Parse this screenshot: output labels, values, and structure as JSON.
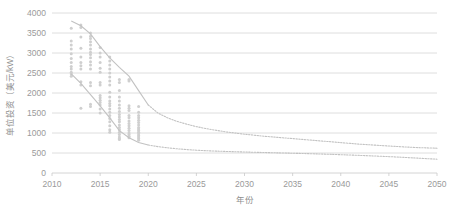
{
  "chart_data": {
    "type": "scatter",
    "title": "",
    "xlabel": "年份",
    "ylabel": "单位投资（美元/kW）",
    "xlim": [
      2010,
      2050
    ],
    "ylim": [
      0,
      4000
    ],
    "xticks": [
      2010,
      2015,
      2020,
      2025,
      2030,
      2035,
      2040,
      2045,
      2050
    ],
    "yticks": [
      0,
      500,
      1000,
      1500,
      2000,
      2500,
      3000,
      3500,
      4000
    ],
    "grid": true,
    "legend": "none",
    "series": [
      {
        "name": "项目散点",
        "type": "scatter",
        "marker": "circle",
        "color": "#cfcfcf",
        "points": [
          [
            2012,
            3620
          ],
          [
            2012,
            3300
          ],
          [
            2012,
            3200
          ],
          [
            2012,
            3100
          ],
          [
            2012,
            2980
          ],
          [
            2012,
            2860
          ],
          [
            2012,
            2760
          ],
          [
            2012,
            2660
          ],
          [
            2012,
            2600
          ],
          [
            2012,
            2520
          ],
          [
            2012,
            2480
          ],
          [
            2012,
            2420
          ],
          [
            2013,
            3700
          ],
          [
            2013,
            3640
          ],
          [
            2013,
            3400
          ],
          [
            2013,
            3120
          ],
          [
            2013,
            2900
          ],
          [
            2013,
            2760
          ],
          [
            2013,
            2680
          ],
          [
            2013,
            2600
          ],
          [
            2013,
            2280
          ],
          [
            2013,
            2200
          ],
          [
            2013,
            1620
          ],
          [
            2014,
            3500
          ],
          [
            2014,
            3420
          ],
          [
            2014,
            3360
          ],
          [
            2014,
            3280
          ],
          [
            2014,
            3200
          ],
          [
            2014,
            3100
          ],
          [
            2014,
            3020
          ],
          [
            2014,
            2960
          ],
          [
            2014,
            2880
          ],
          [
            2014,
            2780
          ],
          [
            2014,
            2700
          ],
          [
            2014,
            2600
          ],
          [
            2014,
            2260
          ],
          [
            2014,
            2180
          ],
          [
            2014,
            1720
          ],
          [
            2014,
            1660
          ],
          [
            2015,
            3140
          ],
          [
            2015,
            3000
          ],
          [
            2015,
            2900
          ],
          [
            2015,
            2760
          ],
          [
            2015,
            2620
          ],
          [
            2015,
            2520
          ],
          [
            2015,
            2260
          ],
          [
            2015,
            2200
          ],
          [
            2015,
            1940
          ],
          [
            2015,
            1880
          ],
          [
            2015,
            1820
          ],
          [
            2015,
            1760
          ],
          [
            2015,
            1700
          ],
          [
            2015,
            1600
          ],
          [
            2015,
            1500
          ],
          [
            2016,
            2900
          ],
          [
            2016,
            2800
          ],
          [
            2016,
            2700
          ],
          [
            2016,
            2600
          ],
          [
            2016,
            2500
          ],
          [
            2016,
            2400
          ],
          [
            2016,
            2300
          ],
          [
            2016,
            2200
          ],
          [
            2016,
            2020
          ],
          [
            2016,
            1900
          ],
          [
            2016,
            1800
          ],
          [
            2016,
            1740
          ],
          [
            2016,
            1680
          ],
          [
            2016,
            1600
          ],
          [
            2016,
            1520
          ],
          [
            2016,
            1440
          ],
          [
            2016,
            1360
          ],
          [
            2016,
            1280
          ],
          [
            2016,
            1180
          ],
          [
            2016,
            1080
          ],
          [
            2016,
            1020
          ],
          [
            2017,
            2340
          ],
          [
            2017,
            2260
          ],
          [
            2017,
            2060
          ],
          [
            2017,
            1900
          ],
          [
            2017,
            1800
          ],
          [
            2017,
            1700
          ],
          [
            2017,
            1620
          ],
          [
            2017,
            1540
          ],
          [
            2017,
            1460
          ],
          [
            2017,
            1400
          ],
          [
            2017,
            1340
          ],
          [
            2017,
            1280
          ],
          [
            2017,
            1200
          ],
          [
            2017,
            1140
          ],
          [
            2017,
            1080
          ],
          [
            2017,
            1020
          ],
          [
            2017,
            960
          ],
          [
            2017,
            900
          ],
          [
            2017,
            860
          ],
          [
            2017,
            840
          ],
          [
            2018,
            2340
          ],
          [
            2018,
            2300
          ],
          [
            2018,
            1680
          ],
          [
            2018,
            1620
          ],
          [
            2018,
            1560
          ],
          [
            2018,
            1440
          ],
          [
            2018,
            1380
          ],
          [
            2018,
            1300
          ],
          [
            2018,
            1240
          ],
          [
            2018,
            1180
          ],
          [
            2018,
            1120
          ],
          [
            2018,
            1060
          ],
          [
            2018,
            1000
          ],
          [
            2018,
            960
          ],
          [
            2018,
            920
          ],
          [
            2018,
            880
          ],
          [
            2019,
            1660
          ],
          [
            2019,
            1520
          ],
          [
            2019,
            1440
          ],
          [
            2019,
            1380
          ],
          [
            2019,
            1320
          ],
          [
            2019,
            1260
          ],
          [
            2019,
            1200
          ],
          [
            2019,
            1140
          ],
          [
            2019,
            1100
          ],
          [
            2019,
            1060
          ],
          [
            2019,
            1020
          ],
          [
            2019,
            980
          ],
          [
            2019,
            940
          ],
          [
            2019,
            900
          ],
          [
            2019,
            860
          ],
          [
            2019,
            820
          ]
        ]
      },
      {
        "name": "上边界趋势",
        "type": "line",
        "style": "solid-then-dotted",
        "color": "#c2c2c2",
        "x": [
          2012,
          2013,
          2014,
          2015,
          2016,
          2017,
          2018,
          2019,
          2020,
          2021,
          2022,
          2023,
          2024,
          2025,
          2026,
          2027,
          2028,
          2029,
          2030,
          2032,
          2034,
          2036,
          2038,
          2040,
          2042,
          2044,
          2046,
          2048,
          2050
        ],
        "values": [
          3800,
          3680,
          3480,
          3160,
          2880,
          2640,
          2420,
          2060,
          1700,
          1500,
          1380,
          1290,
          1220,
          1160,
          1110,
          1070,
          1030,
          1000,
          970,
          920,
          880,
          840,
          800,
          760,
          720,
          690,
          660,
          635,
          620
        ]
      },
      {
        "name": "下边界趋势",
        "type": "line",
        "style": "solid-then-dotted",
        "color": "#c2c2c2",
        "x": [
          2012,
          2013,
          2014,
          2015,
          2016,
          2017,
          2018,
          2019,
          2020,
          2021,
          2022,
          2023,
          2024,
          2025,
          2026,
          2027,
          2028,
          2029,
          2030,
          2032,
          2034,
          2036,
          2038,
          2040,
          2042,
          2044,
          2046,
          2048,
          2050
        ],
        "values": [
          2480,
          2240,
          1960,
          1680,
          1380,
          1060,
          880,
          760,
          700,
          660,
          630,
          605,
          585,
          570,
          558,
          548,
          540,
          532,
          525,
          512,
          500,
          488,
          474,
          458,
          440,
          420,
          398,
          372,
          345
        ]
      }
    ]
  },
  "axis": {
    "y_title": "单位投资（美元/kW）",
    "x_title": "年份",
    "y_tick_labels": [
      "4000",
      "3500",
      "3000",
      "2500",
      "2000",
      "1500",
      "1000",
      "500",
      "0"
    ],
    "x_tick_labels": [
      "2010",
      "2015",
      "2020",
      "2025",
      "2030",
      "2035",
      "2040",
      "2045",
      "2050"
    ]
  },
  "colors": {
    "grid": "#d6d6d6",
    "axis": "#c9c9c9",
    "scatter": "#cfcfcf",
    "curve": "#c2c2c2",
    "text": "#9a9a9a",
    "background": "#ffffff"
  }
}
